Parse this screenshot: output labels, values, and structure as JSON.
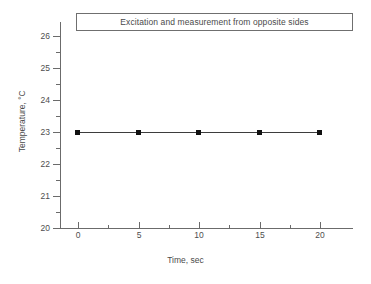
{
  "chart_data": {
    "type": "line",
    "title": "Excitation and measurement from opposite sides",
    "xlabel": "Time, sec",
    "ylabel": "Temperature, °C",
    "x": [
      0,
      5,
      10,
      15,
      20
    ],
    "values": [
      23.0,
      23.0,
      23.0,
      23.0,
      23.0
    ],
    "series": [
      {
        "name": "Temperature",
        "values": [
          23.0,
          23.0,
          23.0,
          23.0,
          23.0
        ],
        "marker": "filled-square",
        "marker_color": "#111111",
        "line_color": "#3d3d3d"
      }
    ],
    "xlim": [
      0,
      20
    ],
    "ylim": [
      20,
      26
    ],
    "xticks": [
      0,
      5,
      10,
      15,
      20
    ],
    "xtick_labels": [
      "0",
      "5",
      "10",
      "15",
      "20"
    ],
    "x_minor_ticks": [
      2.5,
      7.5,
      12.5,
      17.5
    ],
    "yticks": [
      20,
      21,
      22,
      23,
      24,
      25,
      26
    ],
    "ytick_labels": [
      "20",
      "21",
      "22",
      "23",
      "24",
      "25",
      "26"
    ],
    "y_minor_ticks": [
      20.5,
      21.5,
      22.5,
      23.5,
      24.5,
      25.5
    ],
    "grid": false,
    "legend": false,
    "frame": "left-bottom",
    "title_boxed": true,
    "background": "#ffffff",
    "axis_color": "#6b6b6b",
    "text_color": "#4a4a4a"
  }
}
